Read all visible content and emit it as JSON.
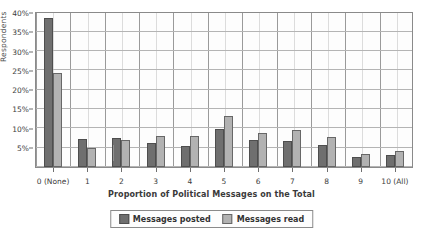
{
  "chart_data": {
    "type": "bar",
    "title": "",
    "xlabel": "Proportion of Political Messages on the Total",
    "ylabel": "Respondents",
    "ylim": [
      0,
      40
    ],
    "ytick_labels": [
      "5%",
      "10%",
      "15%",
      "20%",
      "25%",
      "30%",
      "35%",
      "40%"
    ],
    "ytick_values": [
      5,
      10,
      15,
      20,
      25,
      30,
      35,
      40
    ],
    "grid": true,
    "legend_position": "bottom",
    "categories": [
      "0 (None)",
      "1",
      "2",
      "3",
      "4",
      "5",
      "6",
      "7",
      "8",
      "9",
      "10 (All)"
    ],
    "series": [
      {
        "name": "Messages posted",
        "color": "#6f6f6f",
        "values": [
          38.7,
          7.3,
          7.5,
          6.3,
          5.4,
          9.8,
          7.1,
          6.7,
          5.7,
          2.6,
          3.0
        ]
      },
      {
        "name": "Messages read",
        "color": "#b2b2b2",
        "values": [
          24.3,
          5.0,
          7.0,
          8.0,
          8.0,
          13.2,
          8.9,
          9.5,
          7.9,
          3.4,
          4.2
        ]
      }
    ]
  },
  "legend": {
    "items": [
      {
        "label": "Messages posted"
      },
      {
        "label": "Messages read"
      }
    ]
  }
}
